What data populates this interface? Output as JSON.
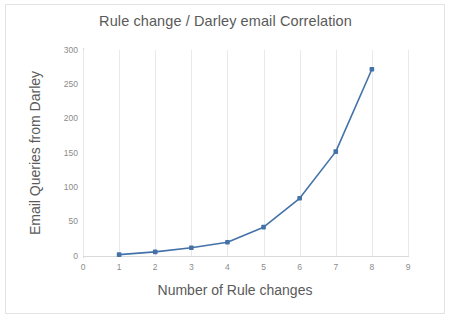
{
  "chart_data": {
    "type": "line",
    "title": "Rule change / Darley email Correlation",
    "xlabel": "Number of Rule changes",
    "ylabel": "Email Queries from Darley",
    "x": [
      1,
      2,
      3,
      4,
      5,
      6,
      7,
      8
    ],
    "values": [
      2,
      6,
      12,
      20,
      42,
      84,
      152,
      272
    ],
    "series": [
      {
        "name": "Email Queries from Darley",
        "values": [
          2,
          6,
          12,
          20,
          42,
          84,
          152,
          272
        ]
      }
    ],
    "xlim": [
      0,
      9
    ],
    "ylim": [
      0,
      300
    ],
    "x_ticks": [
      "0",
      "1",
      "2",
      "3",
      "4",
      "5",
      "6",
      "7",
      "8",
      "9"
    ],
    "y_ticks": [
      "0",
      "50",
      "100",
      "150",
      "200",
      "250",
      "300"
    ],
    "grid": "vertical-only",
    "legend": "none",
    "marker": "square",
    "colors": {
      "line": "#4472a8",
      "marker": "#4472a8",
      "gridline": "#e9e9e9",
      "axis": "#d6d6d6",
      "text": "#5a5a5a",
      "tick_text": "#8b8b8b",
      "background": "#ffffff",
      "frame": "#e3e3e3"
    }
  }
}
